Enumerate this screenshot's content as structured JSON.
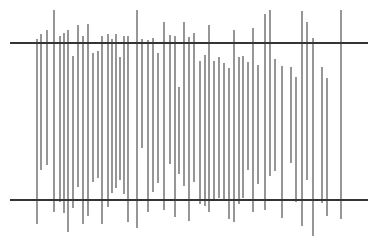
{
  "figure": {
    "title": "",
    "caption": "",
    "background_color": "#ffffff",
    "width": 378,
    "height": 247
  },
  "chart_data": {
    "type": "bar",
    "title": "",
    "subtitle": "",
    "xlabel": "",
    "ylabel": "",
    "grid": false,
    "legend": null,
    "annotations": [],
    "axis_note": "Coordinates are given in image pixel space; y increases downward.",
    "xlim": [
      0,
      378
    ],
    "ylim": [
      0,
      247
    ],
    "reference_lines": [
      {
        "name": "upper-reference-line",
        "orientation": "horizontal",
        "y": 43,
        "x_start": 10,
        "x_end": 368,
        "color": "#343434",
        "thickness": 2.1
      },
      {
        "name": "lower-reference-line",
        "orientation": "horizontal",
        "y": 200,
        "x_start": 10,
        "x_end": 368,
        "color": "#343434",
        "thickness": 2.1
      }
    ],
    "series": [
      {
        "name": "vertical-segments",
        "color": "#4a4a4a",
        "thickness": 1.15,
        "count": 56,
        "segments": [
          {
            "i": 1,
            "x": 37,
            "y_top": 39,
            "y_bottom": 224
          },
          {
            "i": 2,
            "x": 41,
            "y_top": 34,
            "y_bottom": 170
          },
          {
            "i": 3,
            "x": 47,
            "y_top": 30,
            "y_bottom": 165
          },
          {
            "i": 4,
            "x": 54,
            "y_top": 10,
            "y_bottom": 212
          },
          {
            "i": 5,
            "x": 60,
            "y_top": 36,
            "y_bottom": 202
          },
          {
            "i": 6,
            "x": 64,
            "y_top": 33,
            "y_bottom": 213
          },
          {
            "i": 7,
            "x": 68,
            "y_top": 30,
            "y_bottom": 232
          },
          {
            "i": 8,
            "x": 73,
            "y_top": 56,
            "y_bottom": 208
          },
          {
            "i": 9,
            "x": 78,
            "y_top": 25,
            "y_bottom": 187
          },
          {
            "i": 10,
            "x": 83,
            "y_top": 36,
            "y_bottom": 224
          },
          {
            "i": 11,
            "x": 88,
            "y_top": 24,
            "y_bottom": 216
          },
          {
            "i": 12,
            "x": 93,
            "y_top": 53,
            "y_bottom": 182
          },
          {
            "i": 13,
            "x": 98,
            "y_top": 51,
            "y_bottom": 178
          },
          {
            "i": 14,
            "x": 102,
            "y_top": 36,
            "y_bottom": 224
          },
          {
            "i": 15,
            "x": 108,
            "y_top": 34,
            "y_bottom": 207
          },
          {
            "i": 16,
            "x": 112,
            "y_top": 39,
            "y_bottom": 193
          },
          {
            "i": 17,
            "x": 116,
            "y_top": 34,
            "y_bottom": 188
          },
          {
            "i": 18,
            "x": 120,
            "y_top": 57,
            "y_bottom": 180
          },
          {
            "i": 19,
            "x": 124,
            "y_top": 36,
            "y_bottom": 194
          },
          {
            "i": 20,
            "x": 128,
            "y_top": 36,
            "y_bottom": 222
          },
          {
            "i": 21,
            "x": 137,
            "y_top": 10,
            "y_bottom": 228
          },
          {
            "i": 22,
            "x": 142,
            "y_top": 39,
            "y_bottom": 148
          },
          {
            "i": 23,
            "x": 148,
            "y_top": 40,
            "y_bottom": 212
          },
          {
            "i": 24,
            "x": 153,
            "y_top": 38,
            "y_bottom": 192
          },
          {
            "i": 25,
            "x": 158,
            "y_top": 53,
            "y_bottom": 183
          },
          {
            "i": 26,
            "x": 164,
            "y_top": 22,
            "y_bottom": 210
          },
          {
            "i": 27,
            "x": 170,
            "y_top": 35,
            "y_bottom": 164
          },
          {
            "i": 28,
            "x": 175,
            "y_top": 36,
            "y_bottom": 217
          },
          {
            "i": 29,
            "x": 179,
            "y_top": 87,
            "y_bottom": 174
          },
          {
            "i": 30,
            "x": 184,
            "y_top": 22,
            "y_bottom": 186
          },
          {
            "i": 31,
            "x": 189,
            "y_top": 37,
            "y_bottom": 221
          },
          {
            "i": 32,
            "x": 194,
            "y_top": 33,
            "y_bottom": 182
          },
          {
            "i": 33,
            "x": 200,
            "y_top": 61,
            "y_bottom": 204
          },
          {
            "i": 34,
            "x": 205,
            "y_top": 55,
            "y_bottom": 206
          },
          {
            "i": 35,
            "x": 209,
            "y_top": 25,
            "y_bottom": 212
          },
          {
            "i": 36,
            "x": 214,
            "y_top": 61,
            "y_bottom": 200
          },
          {
            "i": 37,
            "x": 219,
            "y_top": 57,
            "y_bottom": 198
          },
          {
            "i": 38,
            "x": 224,
            "y_top": 63,
            "y_bottom": 200
          },
          {
            "i": 39,
            "x": 229,
            "y_top": 68,
            "y_bottom": 219
          },
          {
            "i": 40,
            "x": 234,
            "y_top": 30,
            "y_bottom": 222
          },
          {
            "i": 41,
            "x": 239,
            "y_top": 57,
            "y_bottom": 204
          },
          {
            "i": 42,
            "x": 243,
            "y_top": 56,
            "y_bottom": 198
          },
          {
            "i": 43,
            "x": 248,
            "y_top": 62,
            "y_bottom": 170
          },
          {
            "i": 44,
            "x": 253,
            "y_top": 28,
            "y_bottom": 212
          },
          {
            "i": 45,
            "x": 258,
            "y_top": 65,
            "y_bottom": 184
          },
          {
            "i": 46,
            "x": 265,
            "y_top": 14,
            "y_bottom": 210
          },
          {
            "i": 47,
            "x": 270,
            "y_top": 10,
            "y_bottom": 176
          },
          {
            "i": 48,
            "x": 275,
            "y_top": 59,
            "y_bottom": 171
          },
          {
            "i": 49,
            "x": 282,
            "y_top": 66,
            "y_bottom": 218
          },
          {
            "i": 50,
            "x": 291,
            "y_top": 67,
            "y_bottom": 163
          },
          {
            "i": 51,
            "x": 296,
            "y_top": 77,
            "y_bottom": 202
          },
          {
            "i": 52,
            "x": 302,
            "y_top": 11,
            "y_bottom": 226
          },
          {
            "i": 53,
            "x": 307,
            "y_top": 22,
            "y_bottom": 180
          },
          {
            "i": 54,
            "x": 313,
            "y_top": 38,
            "y_bottom": 236
          },
          {
            "i": 55,
            "x": 322,
            "y_top": 67,
            "y_bottom": 203
          },
          {
            "i": 56,
            "x": 327,
            "y_top": 78,
            "y_bottom": 216
          },
          {
            "i": 57,
            "x": 341,
            "y_top": 10,
            "y_bottom": 219
          }
        ]
      }
    ]
  }
}
